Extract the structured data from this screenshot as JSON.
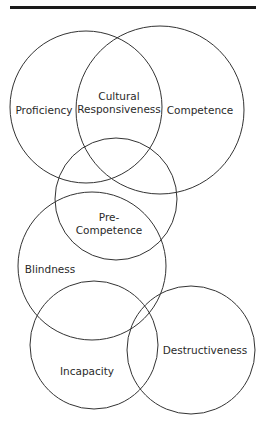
{
  "diagram": {
    "type": "overlapping-circles",
    "stroke_color": "#333333",
    "rule_color": "#1a1a1a",
    "circles": [
      {
        "id": "proficiency",
        "label": "Proficiency",
        "cx": 86,
        "cy": 107,
        "r": 76
      },
      {
        "id": "competence",
        "label": "Competence",
        "cx": 160,
        "cy": 110,
        "r": 84
      },
      {
        "id": "pre-competence",
        "label": "Pre-Competence",
        "cx": 116,
        "cy": 199,
        "r": 61
      },
      {
        "id": "blindness",
        "label": "Blindness",
        "cx": 92,
        "cy": 266,
        "r": 74
      },
      {
        "id": "incapacity",
        "label": "Incapacity",
        "cx": 94,
        "cy": 345,
        "r": 64
      },
      {
        "id": "destructiveness",
        "label": "Destructiveness",
        "cx": 191,
        "cy": 350,
        "r": 64
      }
    ],
    "labels": {
      "proficiency": "Proficiency",
      "cultural_line1": "Cultural",
      "cultural_line2": "Responsiveness",
      "competence": "Competence",
      "pre_line1": "Pre-",
      "pre_line2": "Competence",
      "blindness": "Blindness",
      "incapacity": "Incapacity",
      "destructiveness": "Destructiveness"
    }
  }
}
